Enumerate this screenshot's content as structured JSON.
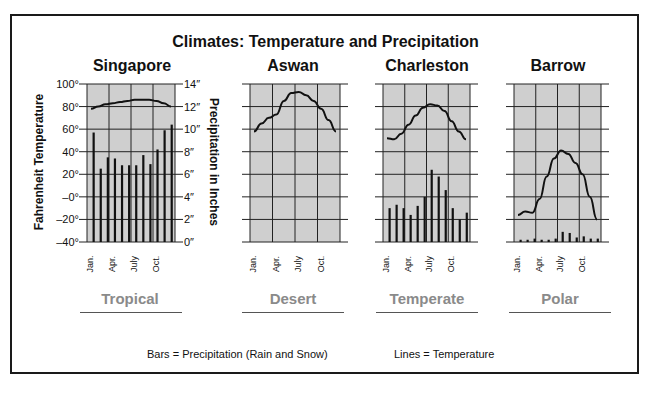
{
  "chart_data": {
    "type": "bar",
    "title": "Climates: Temperature and Precipitation",
    "left_axis": {
      "label": "Fahrenheit Temperature",
      "ticks": [
        "100°",
        "80°",
        "60°",
        "40°",
        "20°",
        "–0°",
        "–20°",
        "–40°"
      ],
      "range": [
        -40,
        100
      ]
    },
    "right_axis": {
      "label": "Precipitation in Inches",
      "ticks": [
        "14″",
        "12″",
        "10″",
        "8″",
        "6″",
        "4″",
        "2″",
        "0″"
      ],
      "range": [
        0,
        14
      ]
    },
    "x_ticks": [
      "Jan.",
      "Apr.",
      "July",
      "Oct."
    ],
    "months": [
      "Jan",
      "Feb",
      "Mar",
      "Apr",
      "May",
      "Jun",
      "Jul",
      "Aug",
      "Sep",
      "Oct",
      "Nov",
      "Dec"
    ],
    "legend": {
      "bars": "Bars = Precipitation (Rain and Snow)",
      "lines": "Lines = Temperature"
    },
    "panels": [
      {
        "city": "Singapore",
        "climate": "Tropical",
        "precipitation_in": [
          9.7,
          6.5,
          7.5,
          7.4,
          6.8,
          6.8,
          6.8,
          7.7,
          6.9,
          8.2,
          9.9,
          10.4
        ],
        "temperature_f": [
          78,
          80,
          82,
          83,
          84,
          85,
          86,
          86,
          86,
          85,
          83,
          80
        ]
      },
      {
        "city": "Aswan",
        "climate": "Desert",
        "precipitation_in": [
          0,
          0,
          0,
          0,
          0,
          0,
          0,
          0,
          0,
          0,
          0,
          0
        ],
        "temperature_f": [
          58,
          65,
          70,
          73,
          85,
          92,
          93,
          90,
          85,
          78,
          68,
          58
        ]
      },
      {
        "city": "Charleston",
        "climate": "Temperate",
        "precipitation_in": [
          3.0,
          3.3,
          3.0,
          2.4,
          3.2,
          4.0,
          6.4,
          5.8,
          4.6,
          3.0,
          2.0,
          2.6
        ],
        "temperature_f": [
          52,
          51,
          56,
          64,
          72,
          79,
          82,
          81,
          76,
          67,
          58,
          51
        ]
      },
      {
        "city": "Barrow",
        "climate": "Polar",
        "precipitation_in": [
          0.2,
          0.2,
          0.3,
          0.2,
          0.2,
          0.3,
          0.9,
          0.8,
          0.4,
          0.5,
          0.3,
          0.3
        ],
        "temperature_f": [
          -16,
          -13,
          -14,
          -2,
          18,
          34,
          41,
          38,
          30,
          20,
          0,
          -20
        ]
      }
    ]
  },
  "labels": {
    "title": "Climates: Temperature and Precipitation",
    "cities": [
      "Singapore",
      "Aswan",
      "Charleston",
      "Barrow"
    ],
    "climates": [
      "Tropical",
      "Desert",
      "Temperate",
      "Polar"
    ],
    "left_axis_label": "Fahrenheit Temperature",
    "right_axis_label": "Precipitation in Inches",
    "legend_bars": "Bars = Precipitation (Rain and Snow)",
    "legend_lines": "Lines = Temperature"
  },
  "colors": {
    "plot_bg": "#cfcfcf",
    "grid": "#222222",
    "bar": "#111111",
    "line": "#111111",
    "climate_label": "#8a8a8a"
  }
}
